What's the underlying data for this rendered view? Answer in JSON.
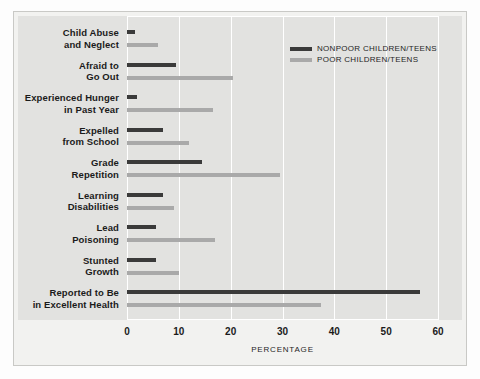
{
  "chart_data": {
    "type": "bar",
    "orientation": "horizontal",
    "title": "",
    "subtitle": "",
    "xlabel": "PERCENTAGE",
    "ylabel": "",
    "xlim": [
      0,
      60
    ],
    "xticks": [
      0,
      10,
      20,
      30,
      40,
      50,
      60
    ],
    "xtick_labels": [
      "0",
      "10",
      "20",
      "30",
      "40",
      "50",
      "60"
    ],
    "grid": "vertical-white-gridlines",
    "legend_position": "top-right",
    "categories": [
      "Child Abuse and Neglect",
      "Afraid to Go Out",
      "Experienced Hunger in Past Year",
      "Expelled from School",
      "Grade Repetition",
      "Learning Disabilities",
      "Lead Poisoning",
      "Stunted Growth",
      "Reported to Be in Excellent Health"
    ],
    "category_lines": [
      [
        "Child Abuse",
        "and Neglect"
      ],
      [
        "Afraid to",
        "Go Out"
      ],
      [
        "Experienced Hunger",
        "in Past Year"
      ],
      [
        "Expelled",
        "from School"
      ],
      [
        "Grade",
        "Repetition"
      ],
      [
        "Learning",
        "Disabilities"
      ],
      [
        "Lead",
        "Poisoning"
      ],
      [
        "Stunted",
        "Growth"
      ],
      [
        "Reported to Be",
        "in Excellent Health"
      ]
    ],
    "series": [
      {
        "name": "NONPOOR CHILDREN/TEENS",
        "color": "#3a3a3a",
        "values": [
          1.5,
          9.5,
          2,
          7,
          14.5,
          7,
          5.5,
          5.5,
          56.5
        ]
      },
      {
        "name": "POOR CHILDREN/TEENS",
        "color": "#a9a9a9",
        "values": [
          6,
          20.5,
          16.5,
          12,
          29.5,
          9,
          17,
          10,
          37.5
        ]
      }
    ]
  },
  "legend": {
    "items": [
      {
        "label": "NONPOOR CHILDREN/TEENS",
        "color": "#3a3a3a"
      },
      {
        "label": "POOR CHILDREN/TEENS",
        "color": "#a9a9a9"
      }
    ]
  },
  "colors": {
    "background": "#fdfdfd",
    "plate": "#f2f2f0",
    "panel": "#e2e2e0",
    "gridline": "#ffffff",
    "nonpoor": "#3a3a3a",
    "poor": "#a9a9a9",
    "text": "#1b1b1b"
  }
}
